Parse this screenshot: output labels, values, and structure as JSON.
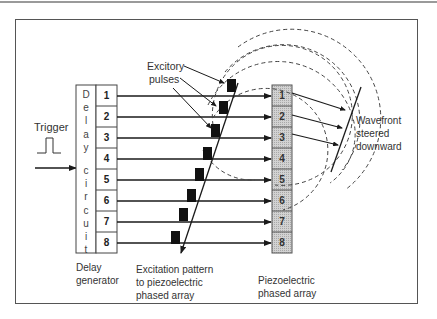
{
  "labels": {
    "trigger": "Trigger",
    "excitory_line1": "Excitory",
    "excitory_line2": "pulses",
    "delay_vertical": [
      "D",
      "e",
      "l",
      "a",
      "y",
      "c",
      "i",
      "r",
      "c",
      "u",
      "i",
      "t"
    ],
    "delay_gen_line1": "Delay",
    "delay_gen_line2": "generator",
    "excitation_line1": "Excitation pattern",
    "excitation_line2": "to piezoelectric",
    "excitation_line3": "phased array",
    "piezo_line1": "Piezoelectric",
    "piezo_line2": "phased array",
    "wavefront_line1": "Wavefront",
    "wavefront_line2": "steered",
    "wavefront_line3": "downward"
  },
  "delay_channels": [
    "1",
    "2",
    "3",
    "4",
    "5",
    "6",
    "7",
    "8"
  ],
  "array_elements": [
    "1",
    "2",
    "3",
    "4",
    "5",
    "6",
    "7",
    "8"
  ],
  "colors": {
    "line": "#1a1a1a",
    "element_fill": "#c8c8c8",
    "pulse": "#111111",
    "dashed": "#444444",
    "frame": "#555555"
  }
}
